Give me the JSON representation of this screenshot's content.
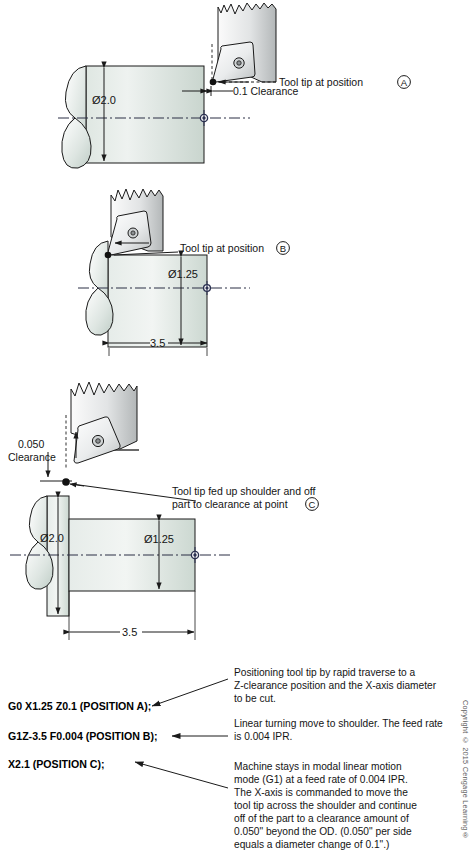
{
  "figure": {
    "colors": {
      "part_fill_light": "#f2f5f3",
      "part_fill_dark": "#cdd8d2",
      "tool_fill_light": "#fdfdfd",
      "tool_fill_dark": "#b9bcbd",
      "insert_fill_light": "#ffffff",
      "insert_fill_dark": "#c3c7c8",
      "line": "#1a1a1a",
      "centerline": "#2b2f45",
      "origin_marker": "#2a3050"
    }
  },
  "panel_a": {
    "name": "Position A - rapid to clearance",
    "part_diameter_label": "Ø2.0",
    "tool_tip_label": "Tool tip at position",
    "tool_tip_letter": "A",
    "clearance_label": "0.1 Clearance"
  },
  "panel_b": {
    "name": "Position B - linear turn to shoulder",
    "part_diameter_label": "Ø1.25",
    "tool_tip_label": "Tool tip at position",
    "tool_tip_letter": "B",
    "length_label": "3.5"
  },
  "panel_c": {
    "name": "Position C - feed up shoulder and off part",
    "clearance_value": "0.050",
    "clearance_word": "Clearance",
    "large_diameter_label": "Ø2.0",
    "small_diameter_label": "Ø1.25",
    "length_label": "3.5",
    "tool_tip_label_line1": "Tool tip fed up shoulder and off",
    "tool_tip_label_line2": "part to clearance at point",
    "tool_tip_letter": "C"
  },
  "program": {
    "lines": [
      {
        "code": "G0 X1.25 Z0.1 (POSITION A);",
        "description": [
          "Positioning tool tip by rapid traverse to a",
          "Z-clearance position and the X-axis diameter",
          "to be cut."
        ]
      },
      {
        "code": "G1Z-3.5 F0.004 (POSITION B);",
        "description": [
          "Linear turning move to shoulder. The feed rate",
          "is 0.004 IPR."
        ]
      },
      {
        "code": "X2.1 (POSITION C);",
        "description": [
          "Machine stays in modal linear motion",
          "mode (G1) at a feed rate of 0.004 IPR.",
          "The X-axis is commanded to move the",
          "tool tip across the shoulder and continue",
          "off of the part to a clearance amount of",
          "0.050\" beyond the OD. (0.050\" per side",
          "equals a diameter change of 0.1\".)"
        ]
      }
    ]
  },
  "copyright": "Copyright © 2015 Cengage Learning®"
}
